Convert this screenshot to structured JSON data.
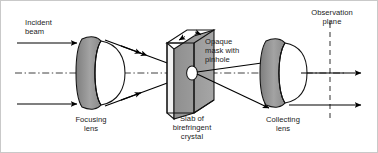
{
  "figure": {
    "kind": "optical-setup-diagram",
    "title_text": "",
    "background_color": "#ffffff",
    "line_color": "#000000",
    "border_color": "#c9c9c9"
  },
  "labels": {
    "incident_beam": "Incident\nbeam",
    "focusing_lens": "Focusing\nlens",
    "opaque_mask": "Opaque\nmask with\npinhole",
    "slab": "Slab of\nbirefringent\ncrystal",
    "collecting_lens": "Collecting\nlens",
    "observation_plane": "Observation\nplane"
  },
  "components": {
    "focusing_lens": {
      "name": "focusing-lens",
      "type": "plano-convex-lens",
      "body_fill": "#ffffff",
      "rim_fill": "#8c8c8c",
      "center_x": 92,
      "center_y": 72
    },
    "crystal_slab": {
      "name": "birefringent-crystal-slab",
      "type": "isometric-slab",
      "front_fill": "#9a9a9a",
      "top_fill": "#ffffff",
      "side_fill": "#e8e8e8",
      "pinhole_fill": "#ffffff",
      "pinhole_x": 191,
      "pinhole_y": 72
    },
    "collecting_lens": {
      "name": "collecting-lens",
      "type": "plano-convex-lens",
      "body_fill": "#ffffff",
      "rim_fill": "#8c8c8c",
      "center_x": 279,
      "center_y": 72
    },
    "observation_plane": {
      "name": "observation-plane",
      "type": "dashed-vertical-line",
      "x": 329,
      "stroke": "#5a5a5a"
    },
    "optical_axis": {
      "name": "optical-axis",
      "type": "dash-dot-horizontal-line",
      "y": 72
    }
  },
  "rays": {
    "incoming": [
      {
        "name": "incident-ray-upper",
        "x1": 16,
        "y1": 42,
        "x2": 74,
        "y2": 42
      },
      {
        "name": "incident-ray-lower",
        "x1": 16,
        "y1": 103,
        "x2": 74,
        "y2": 103
      }
    ],
    "converging": [
      {
        "name": "converging-ray-upper",
        "x1": 106,
        "y1": 40,
        "x2": 186,
        "y2": 70
      },
      {
        "name": "converging-ray-lower",
        "x1": 106,
        "y1": 104,
        "x2": 186,
        "y2": 74
      }
    ],
    "diverging": [
      {
        "name": "diverging-ray-upper",
        "x1": 196,
        "y1": 71,
        "x2": 266,
        "y2": 61
      },
      {
        "name": "diverging-ray-lower",
        "x1": 196,
        "y1": 73,
        "x2": 266,
        "y2": 106
      }
    ],
    "outgoing": [
      {
        "name": "output-ray-upper",
        "x1": 296,
        "y1": 72,
        "x2": 360,
        "y2": 72
      },
      {
        "name": "output-ray-lower",
        "x1": 296,
        "y1": 104,
        "x2": 360,
        "y2": 104
      }
    ]
  }
}
